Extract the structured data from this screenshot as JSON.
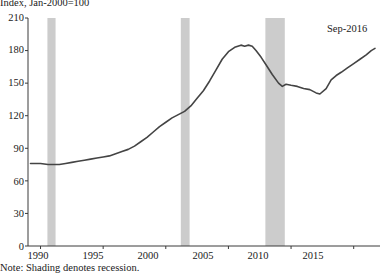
{
  "chart_data": {
    "type": "line",
    "title": "Index, Jan-2000=100",
    "ylabel": "Index, Jan-2000=100",
    "xlabel": "",
    "note": "Note: Shading denotes recession.",
    "annotation": "Sep-2016",
    "grid": false,
    "legend": "none",
    "xlim": [
      1989.0,
      2017.1
    ],
    "ylim": [
      0,
      210
    ],
    "yticks": [
      0,
      30,
      60,
      90,
      120,
      150,
      180,
      210
    ],
    "ytick_labels": [
      "0",
      "30",
      "60",
      "90",
      "120",
      "150",
      "180",
      "210"
    ],
    "xticks": [
      1990,
      1995,
      2000,
      2005,
      2010,
      2015
    ],
    "xtick_labels": [
      "1990",
      "1995",
      "2000",
      "2005",
      "2010",
      "2015"
    ],
    "line_color": "#444444",
    "shading_color": "#cccccc",
    "recessions": [
      {
        "start": 1990.55,
        "end": 1991.2
      },
      {
        "start": 2001.2,
        "end": 2001.9
      },
      {
        "start": 2007.95,
        "end": 2009.5
      }
    ],
    "series": [
      {
        "name": "Index",
        "x": [
          1989.2,
          1990.0,
          1990.6,
          1991.0,
          1991.5,
          1992.0,
          1992.5,
          1993.0,
          1993.5,
          1994.0,
          1994.5,
          1995.0,
          1995.5,
          1996.0,
          1996.5,
          1997.0,
          1997.5,
          1998.0,
          1998.5,
          1999.0,
          1999.5,
          2000.0,
          2000.5,
          2001.0,
          2001.5,
          2002.0,
          2002.5,
          2003.0,
          2003.5,
          2004.0,
          2004.5,
          2005.0,
          2005.5,
          2006.0,
          2006.3,
          2006.6,
          2006.9,
          2007.2,
          2007.6,
          2008.0,
          2008.5,
          2009.0,
          2009.3,
          2009.6,
          2010.0,
          2010.5,
          2011.0,
          2011.5,
          2012.0,
          2012.3,
          2012.8,
          2013.2,
          2013.6,
          2014.0,
          2014.5,
          2015.0,
          2015.5,
          2016.0,
          2016.4,
          2016.7
        ],
        "y": [
          76,
          76,
          75,
          75,
          75,
          76,
          77,
          78,
          79,
          80,
          81,
          82,
          83,
          85,
          87,
          89,
          92,
          96,
          100,
          105,
          110,
          114,
          118,
          121,
          124,
          129,
          136,
          143,
          152,
          162,
          172,
          179,
          183,
          185,
          184,
          185,
          184,
          180,
          174,
          167,
          158,
          150,
          147,
          149,
          148,
          147,
          145,
          144,
          141,
          140,
          145,
          153,
          157,
          160,
          164,
          168,
          172,
          176,
          180,
          182
        ]
      }
    ],
    "last_value": 182,
    "last_label": "Sep-2016"
  },
  "ylabel_positions": [
    {
      "label": "210",
      "y": 12
    },
    {
      "label": "180",
      "y": 44
    },
    {
      "label": "150",
      "y": 77
    },
    {
      "label": "120",
      "y": 110
    },
    {
      "label": "90",
      "y": 143
    },
    {
      "label": "60",
      "y": 176
    },
    {
      "label": "30",
      "y": 208
    },
    {
      "label": "0",
      "y": 241
    }
  ],
  "xlabel_positions": [
    {
      "label": "1990",
      "x": 18
    },
    {
      "label": "1995",
      "x": 73
    },
    {
      "label": "2000",
      "x": 128
    },
    {
      "label": "2005",
      "x": 183
    },
    {
      "label": "2010",
      "x": 238
    },
    {
      "label": "2015",
      "x": 293
    }
  ]
}
